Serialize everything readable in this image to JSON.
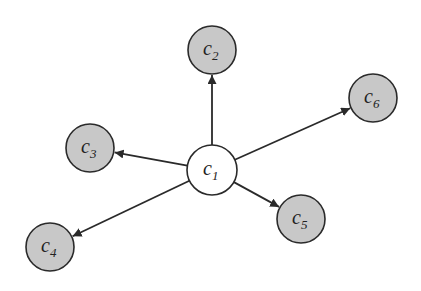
{
  "diagram": {
    "type": "star-graph",
    "center_node": "c1",
    "colors": {
      "center_fill": "#ffffff",
      "leaf_fill": "#c8c8c8",
      "stroke": "#2a2a2a",
      "edge": "#2a2a2a",
      "background": "#ffffff"
    },
    "nodes": [
      {
        "id": "c1",
        "base": "c",
        "sub": "1",
        "x": 212,
        "y": 170,
        "r": 25,
        "fill": "center"
      },
      {
        "id": "c2",
        "base": "c",
        "sub": "2",
        "x": 212,
        "y": 50,
        "r": 24,
        "fill": "leaf"
      },
      {
        "id": "c3",
        "base": "c",
        "sub": "3",
        "x": 90,
        "y": 148,
        "r": 24,
        "fill": "leaf"
      },
      {
        "id": "c4",
        "base": "c",
        "sub": "4",
        "x": 50,
        "y": 247,
        "r": 24,
        "fill": "leaf"
      },
      {
        "id": "c5",
        "base": "c",
        "sub": "5",
        "x": 301,
        "y": 219,
        "r": 24,
        "fill": "leaf"
      },
      {
        "id": "c6",
        "base": "c",
        "sub": "6",
        "x": 373,
        "y": 98,
        "r": 24,
        "fill": "leaf"
      }
    ],
    "edges": [
      {
        "from": "c1",
        "to": "c2",
        "directed": true
      },
      {
        "from": "c1",
        "to": "c3",
        "directed": true
      },
      {
        "from": "c1",
        "to": "c4",
        "directed": true
      },
      {
        "from": "c1",
        "to": "c5",
        "directed": true
      },
      {
        "from": "c1",
        "to": "c6",
        "directed": true
      }
    ]
  }
}
